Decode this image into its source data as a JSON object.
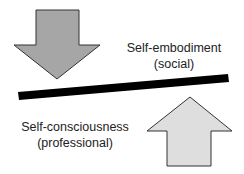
{
  "diagram": {
    "top_label": {
      "line1": "Self-embodiment",
      "line2": "(social)"
    },
    "bottom_label": {
      "line1": "Self-consciousness",
      "line2": "(professional)"
    },
    "arrows": [
      {
        "direction": "down",
        "fill": "#a6a6a6"
      },
      {
        "direction": "up",
        "fill": "#dedede"
      }
    ],
    "bar_color": "#000000"
  }
}
